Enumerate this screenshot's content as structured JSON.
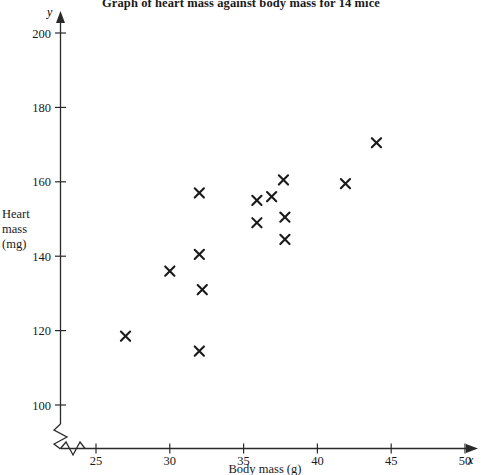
{
  "chart_data": {
    "type": "scatter",
    "title": "Graph of heart mass against body mass for 14 mice",
    "xlabel": "Body mass (g)",
    "ylabel_lines": [
      "Heart",
      "mass",
      "(mg)"
    ],
    "ylabel": "Heart mass (mg)",
    "x_axis_letter": "x",
    "y_axis_letter": "y",
    "xlim": [
      23,
      50.6
    ],
    "ylim": [
      96,
      203
    ],
    "xticks": [
      25,
      30,
      35,
      40,
      45,
      50
    ],
    "yticks": [
      100,
      120,
      140,
      160,
      180,
      200
    ],
    "grid": false,
    "legend": "none",
    "axis_break": true,
    "marker": "x-cross",
    "marker_color": "#1a1a1a",
    "n_points": 14,
    "points": [
      {
        "x": 27.0,
        "y": 118.5
      },
      {
        "x": 30.0,
        "y": 136.0
      },
      {
        "x": 32.0,
        "y": 157.0
      },
      {
        "x": 32.0,
        "y": 140.5
      },
      {
        "x": 32.2,
        "y": 131.0
      },
      {
        "x": 32.0,
        "y": 114.5
      },
      {
        "x": 35.9,
        "y": 155.0
      },
      {
        "x": 35.9,
        "y": 149.0
      },
      {
        "x": 36.9,
        "y": 156.0
      },
      {
        "x": 37.7,
        "y": 160.5
      },
      {
        "x": 37.8,
        "y": 150.5
      },
      {
        "x": 37.8,
        "y": 144.5
      },
      {
        "x": 41.9,
        "y": 159.5
      },
      {
        "x": 44.0,
        "y": 170.5
      }
    ]
  }
}
